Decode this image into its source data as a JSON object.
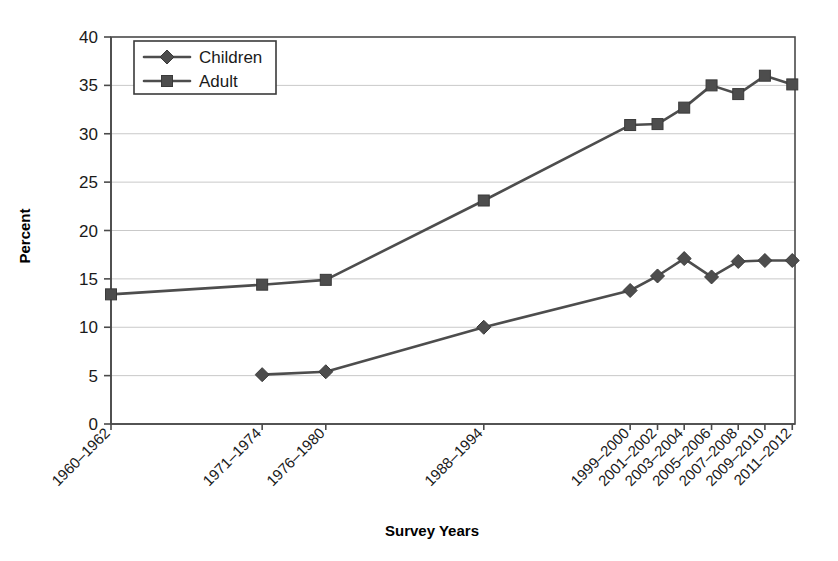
{
  "chart_data": {
    "type": "line",
    "title": "",
    "xlabel": "Survey Years",
    "ylabel": "Percent",
    "ylim": [
      0,
      40
    ],
    "ytick_step": 5,
    "yticks": [
      "0",
      "5",
      "10",
      "15",
      "20",
      "25",
      "30",
      "35",
      "40"
    ],
    "grid": true,
    "legend_position": "upper-left-inside",
    "categories": [
      "1960–1962",
      "1971–1974",
      "1976–1980",
      "1988–1994",
      "1999–2000",
      "2001–2002",
      "2003–2004",
      "2005–2006",
      "2007–2008",
      "2009–2010",
      "2011–2012"
    ],
    "category_x_fractions": [
      0.0,
      0.221,
      0.314,
      0.545,
      0.759,
      0.799,
      0.838,
      0.878,
      0.917,
      0.956,
      0.996
    ],
    "series": [
      {
        "name": "Children",
        "marker": "diamond",
        "color": "#4d4d4d",
        "values": [
          null,
          5.1,
          5.4,
          10.0,
          13.8,
          15.3,
          17.1,
          15.2,
          16.8,
          16.9,
          16.9
        ]
      },
      {
        "name": "Adult",
        "marker": "square",
        "color": "#4d4d4d",
        "values": [
          13.4,
          14.4,
          14.9,
          23.1,
          30.9,
          31.0,
          32.7,
          35.0,
          34.1,
          36.0,
          35.1
        ]
      }
    ]
  },
  "legend": {
    "entries": [
      {
        "label": "Children",
        "marker": "diamond"
      },
      {
        "label": "Adult",
        "marker": "square"
      }
    ]
  },
  "colors": {
    "series": "#4d4d4d",
    "gridline": "#c9c9c9",
    "axis": "#4a4a4a",
    "text": "#1a1a1a",
    "background": "#ffffff"
  }
}
